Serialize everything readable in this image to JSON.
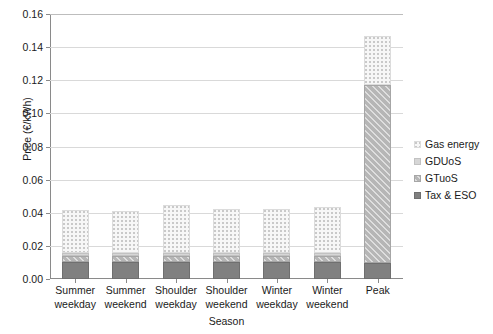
{
  "chart_data": {
    "type": "bar",
    "stacked": true,
    "title": "",
    "xlabel": "Season",
    "ylabel": "Price (€/kWh)",
    "ylim": [
      0,
      0.16
    ],
    "ytick_labels": [
      "0.00",
      "0.02",
      "0.04",
      "0.06",
      "0.08",
      "0.10",
      "0.12",
      "0.14",
      "0.16"
    ],
    "ytick_values": [
      0,
      0.02,
      0.04,
      0.06,
      0.08,
      0.1,
      0.12,
      0.14,
      0.16
    ],
    "grid": "horizontal",
    "legend_position": "right",
    "categories": [
      "Summer weekday",
      "Summer weekend",
      "Shoulder weekday",
      "Shoulder weekend",
      "Winter weekday",
      "Winter weekend",
      "Peak"
    ],
    "series": [
      {
        "name": "Tax & ESO",
        "color": "#808080",
        "values": [
          0.01,
          0.01,
          0.01,
          0.01,
          0.01,
          0.01,
          0.0097
        ]
      },
      {
        "name": "GTuoS",
        "color": "#b6b6b6",
        "values": [
          0.0037,
          0.0037,
          0.0037,
          0.0037,
          0.0037,
          0.0037,
          0.1073
        ]
      },
      {
        "name": "GDUoS",
        "color": "#d6d6d6",
        "values": [
          0.0018,
          0.0018,
          0.0018,
          0.0018,
          0.0018,
          0.0018,
          0.0
        ]
      },
      {
        "name": "Gas energy",
        "color": "#f7f7f7",
        "values": [
          0.026,
          0.0257,
          0.029,
          0.027,
          0.0266,
          0.0281,
          0.03
        ]
      }
    ],
    "totals": [
      0.0415,
      0.0412,
      0.0445,
      0.0425,
      0.0421,
      0.0436,
      0.147
    ]
  },
  "legend": {
    "items": [
      {
        "label": "Gas energy"
      },
      {
        "label": "GDUoS"
      },
      {
        "label": "GTuoS"
      },
      {
        "label": "Tax & ESO"
      }
    ]
  }
}
